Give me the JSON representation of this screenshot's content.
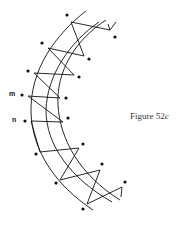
{
  "figure": {
    "caption_prefix": "Figure 52",
    "caption_suffix": "c",
    "labels": {
      "m": "m",
      "n": "n"
    }
  },
  "diagram": {
    "stroke_color": "#111111",
    "background": "#ffffff"
  }
}
